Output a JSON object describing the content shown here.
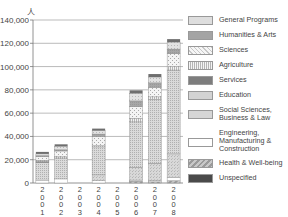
{
  "chart_data": {
    "type": "bar",
    "stacked": true,
    "title": "",
    "xlabel": "",
    "ylabel": "人",
    "ylim": [
      0,
      140000
    ],
    "yticks": [
      "0",
      "20,000",
      "40,000",
      "60,000",
      "80,000",
      "100,000",
      "120,000",
      "140,000"
    ],
    "categories": [
      "2001",
      "2002",
      "2003",
      "2004",
      "2005",
      "2006",
      "2007",
      "2008"
    ],
    "grid": true,
    "legend_position": "right",
    "series": [
      {
        "name": "Unspecified",
        "color": "#555555",
        "values": [
          0,
          0,
          0,
          0,
          0,
          0,
          0,
          0
        ]
      },
      {
        "name": "Health & Well-being",
        "color": "#a8a8a8",
        "values": [
          0,
          0,
          0,
          0,
          0,
          1500,
          1000,
          2000
        ]
      },
      {
        "name": "Engineering, Manufacturing & Construction",
        "color": "#ffffff",
        "values": [
          2500,
          3500,
          0,
          2000,
          0,
          1000,
          1000,
          3000
        ]
      },
      {
        "name": "Social Sciences, Business & Law",
        "color": "#d4d4d4",
        "values": [
          0,
          0,
          0,
          5000,
          0,
          11000,
          15000,
          20000
        ]
      },
      {
        "name": "Education",
        "color": "#cfcfcf",
        "values": [
          15000,
          18000,
          0,
          24000,
          0,
          39000,
          55000,
          72000
        ]
      },
      {
        "name": "Services",
        "color": "#8a8a8a",
        "values": [
          1000,
          0,
          0,
          0,
          0,
          0,
          0,
          0
        ]
      },
      {
        "name": "Agriculture",
        "color": "#e6e6e6",
        "values": [
          1000,
          1000,
          0,
          1000,
          0,
          3000,
          2000,
          3000
        ]
      },
      {
        "name": "Sciences",
        "color": "#eeeeee",
        "values": [
          3000,
          5000,
          0,
          8000,
          0,
          10000,
          8000,
          11000
        ]
      },
      {
        "name": "Humanities & Arts",
        "color": "#9a9a9a",
        "values": [
          1000,
          1000,
          0,
          2000,
          0,
          5000,
          4000,
          4000
        ]
      },
      {
        "name": "General Programs",
        "color": "#bdbdbd",
        "values": [
          1500,
          3000,
          0,
          3000,
          0,
          6500,
          5000,
          6000
        ]
      }
    ],
    "topcaps": [
      {
        "name": "Unspecified-top",
        "color": "#555555",
        "values": [
          0,
          0,
          0,
          0,
          0,
          0,
          0,
          0
        ]
      }
    ]
  },
  "legend": {
    "items": [
      {
        "label": "General Programs",
        "pattern": "dots-light"
      },
      {
        "label": "Humanities & Arts",
        "pattern": "solid-mid"
      },
      {
        "label": "Sciences",
        "pattern": "dots-sparse"
      },
      {
        "label": "Agriculture",
        "pattern": "vlines"
      },
      {
        "label": "Services",
        "pattern": "solid-dark"
      },
      {
        "label": "Education",
        "pattern": "dots-dense"
      },
      {
        "label": "Social Sciences, Business & Law",
        "pattern": "dots-med"
      },
      {
        "label": "Engineering, Manufacturing & Construction",
        "pattern": "white"
      },
      {
        "label": "Health & Well-being",
        "pattern": "diagonal"
      },
      {
        "label": "Unspecified",
        "pattern": "solid-darkest"
      }
    ]
  },
  "axis": {
    "unit_label": "人"
  }
}
